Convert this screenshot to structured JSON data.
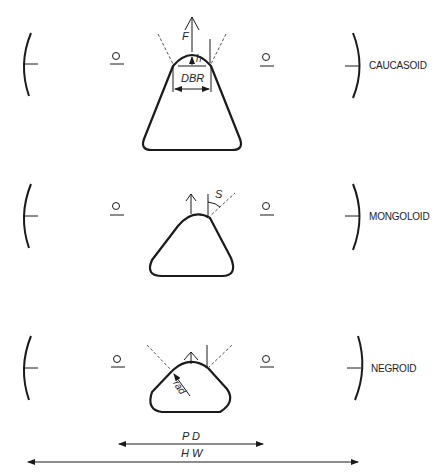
{
  "rows": [
    {
      "label": "CAUCASOID",
      "annotations": {
        "tip_vector": "F",
        "height": "h",
        "width": "DBR"
      }
    },
    {
      "label": "MONGOLOID",
      "annotations": {
        "angle": "S"
      }
    },
    {
      "label": "NEGROID",
      "annotations": {
        "radius": "rad"
      }
    }
  ],
  "dimensions": {
    "pupillary_distance": "P D",
    "head_width": "H W"
  },
  "colors": {
    "line": "#1a1a1a",
    "dashed": "#555555"
  }
}
